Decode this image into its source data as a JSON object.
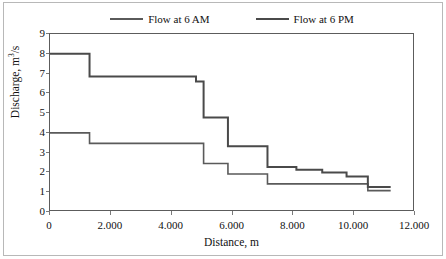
{
  "chart_data": {
    "type": "line",
    "subtype": "step-post",
    "title": "",
    "xlabel": "Distance, m",
    "ylabel": "Discharge, m³/s",
    "xlim": [
      0,
      12000
    ],
    "ylim": [
      0,
      9
    ],
    "xticks": [
      0,
      2000,
      4000,
      6000,
      8000,
      10000,
      12000
    ],
    "xticklabels": [
      "0",
      "2.000",
      "4.000",
      "6.000",
      "8.000",
      "10.000",
      "12.000"
    ],
    "yticks": [
      0,
      1,
      2,
      3,
      4,
      5,
      6,
      7,
      8,
      9
    ],
    "yticklabels": [
      "0",
      "1",
      "2",
      "3",
      "4",
      "5",
      "6",
      "7",
      "8",
      "9"
    ],
    "grid": false,
    "legend_position": "top-center",
    "series": [
      {
        "name": "Flow at 6 AM",
        "color": "#5a5a5a",
        "x": [
          0,
          1300,
          5050,
          5850,
          7150,
          10450,
          11200
        ],
        "y": [
          4.0,
          3.47,
          2.45,
          1.92,
          1.42,
          1.08,
          1.08
        ]
      },
      {
        "name": "Flow at 6 PM",
        "color": "#4a4a4a",
        "x": [
          0,
          1300,
          4800,
          5050,
          5850,
          7150,
          8100,
          8950,
          9750,
          10450,
          11200
        ],
        "y": [
          8.0,
          6.85,
          6.6,
          4.78,
          3.33,
          2.28,
          2.13,
          2.0,
          1.8,
          1.27,
          1.27
        ]
      }
    ]
  },
  "legend": {
    "items": [
      {
        "label": "Flow at 6 AM"
      },
      {
        "label": "Flow at 6 PM"
      }
    ]
  },
  "axes": {
    "x_title": "Distance, m",
    "y_title_main": "Discharge, m",
    "y_title_sup": "3",
    "y_title_tail": "/s"
  }
}
